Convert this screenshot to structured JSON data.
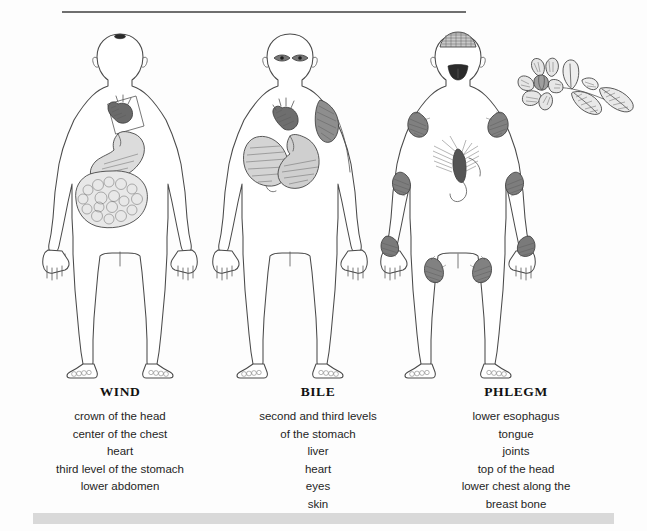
{
  "page": {
    "background_color": "#fdfdfd",
    "rule_color": "#6f6f6f",
    "band_color": "#d9d9d9"
  },
  "figures": [
    {
      "id": "wind",
      "name": "wind-figure",
      "description": "front view human body outline with heart, stomach and coiled intestines shaded",
      "markers": [
        "crown-dot",
        "heart",
        "stomach",
        "intestines"
      ]
    },
    {
      "id": "bile",
      "name": "bile-figure",
      "description": "front view human body outline with eyes, heart, liver, stomach and shaded skin patch on shoulder",
      "markers": [
        "eyes",
        "heart",
        "liver",
        "stomach",
        "skin-patch"
      ]
    },
    {
      "id": "phlegm",
      "name": "phlegm-figure",
      "description": "front view human body outline with hatched crown of head, tongue, sternum region and joint markings",
      "markers": [
        "crown-cap",
        "tongue",
        "sternum",
        "shoulder-joints",
        "elbow-joints",
        "wrist-joints",
        "hip-joints"
      ]
    }
  ],
  "decoration": {
    "flower": {
      "name": "flower-illustration",
      "description": "line drawing of a flower with leaves"
    }
  },
  "columns": [
    {
      "title": "WIND",
      "items": [
        "crown of the head",
        "center of the chest",
        "heart",
        "third level of the stomach",
        "lower abdomen"
      ]
    },
    {
      "title": "BILE",
      "items": [
        "second and third levels",
        "of the stomach",
        "liver",
        "heart",
        "eyes",
        "skin"
      ]
    },
    {
      "title": "PHLEGM",
      "items": [
        "lower esophagus",
        "tongue",
        "joints",
        "top of the head",
        "lower chest along the",
        "breast bone"
      ]
    }
  ]
}
